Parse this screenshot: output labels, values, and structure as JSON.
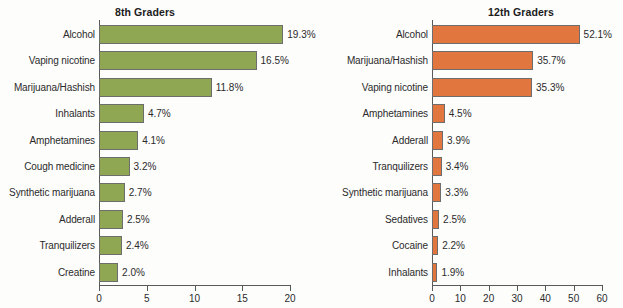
{
  "figure": {
    "background_color": "#fdfdfc",
    "text_color": "#2b2b2b"
  },
  "chart_data": [
    {
      "type": "bar",
      "orientation": "horizontal",
      "title": "8th Graders",
      "xlabel": "",
      "ylabel": "",
      "xlim": [
        0,
        20
      ],
      "xticks": [
        0,
        5,
        10,
        15,
        20
      ],
      "xtick_labels": [
        "0",
        "5",
        "10",
        "15",
        "20"
      ],
      "grid": false,
      "legend": "none",
      "bar_color": "#8fa653",
      "bar_edge_color": "#6d6d6d",
      "categories": [
        "Alcohol",
        "Vaping nicotine",
        "Marijuana/Hashish",
        "Inhalants",
        "Amphetamines",
        "Cough medicine",
        "Synthetic marijuana",
        "Adderall",
        "Tranquilizers",
        "Creatine"
      ],
      "values": [
        19.3,
        16.5,
        11.8,
        4.7,
        4.1,
        3.2,
        2.7,
        2.5,
        2.4,
        2.0
      ],
      "data_labels": [
        "19.3%",
        "16.5%",
        "11.8%",
        "4.7%",
        "4.1%",
        "3.2%",
        "2.7%",
        "2.5%",
        "2.4%",
        "2.0%"
      ]
    },
    {
      "type": "bar",
      "orientation": "horizontal",
      "title": "12th Graders",
      "xlabel": "",
      "ylabel": "",
      "xlim": [
        0,
        60
      ],
      "xticks": [
        0,
        10,
        20,
        30,
        40,
        50,
        60
      ],
      "xtick_labels": [
        "0",
        "10",
        "20",
        "30",
        "40",
        "50",
        "60"
      ],
      "grid": false,
      "legend": "none",
      "bar_color": "#e2763f",
      "bar_edge_color": "#6d6d6d",
      "categories": [
        "Alcohol",
        "Marijuana/Hashish",
        "Vaping nicotine",
        "Amphetamines",
        "Adderall",
        "Tranquilizers",
        "Synthetic marijuana",
        "Sedatives",
        "Cocaine",
        "Inhalants"
      ],
      "values": [
        52.1,
        35.7,
        35.3,
        4.5,
        3.9,
        3.4,
        3.3,
        2.5,
        2.2,
        1.9
      ],
      "data_labels": [
        "52.1%",
        "35.7%",
        "35.3%",
        "4.5%",
        "3.9%",
        "3.4%",
        "3.3%",
        "2.5%",
        "2.2%",
        "1.9%"
      ]
    }
  ]
}
